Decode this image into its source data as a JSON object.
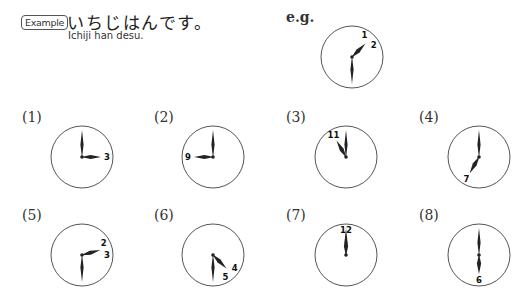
{
  "example": {
    "badge": "Example",
    "japanese": "いちじはんです。",
    "romaji": "Ichiji han desu.",
    "eg_label": "e.g."
  },
  "clocks": [
    {
      "id": "eg",
      "label": "",
      "cx": 352,
      "cy": 57,
      "hour_angle": 45,
      "minute_angle": 180,
      "numbers": [
        {
          "text": "1",
          "angle": 30
        },
        {
          "text": "2",
          "angle": 60
        }
      ]
    },
    {
      "id": "q1",
      "label": "(1)",
      "label_x": 22,
      "label_y": 109,
      "cx": 82,
      "cy": 157,
      "hour_angle": 90,
      "minute_angle": 0,
      "numbers": [
        {
          "text": "3",
          "angle": 90
        }
      ]
    },
    {
      "id": "q2",
      "label": "(2)",
      "label_x": 154,
      "label_y": 109,
      "cx": 213,
      "cy": 157,
      "hour_angle": 270,
      "minute_angle": 0,
      "numbers": [
        {
          "text": "9",
          "angle": 270
        }
      ]
    },
    {
      "id": "q3",
      "label": "(3)",
      "label_x": 286,
      "label_y": 109,
      "cx": 346,
      "cy": 157,
      "hour_angle": 330,
      "minute_angle": 0,
      "numbers": [
        {
          "text": "11",
          "angle": 330
        }
      ]
    },
    {
      "id": "q4",
      "label": "(4)",
      "label_x": 419,
      "label_y": 109,
      "cx": 479,
      "cy": 157,
      "hour_angle": 210,
      "minute_angle": 0,
      "numbers": [
        {
          "text": "7",
          "angle": 210
        }
      ]
    },
    {
      "id": "q5",
      "label": "(5)",
      "label_x": 22,
      "label_y": 207,
      "cx": 82,
      "cy": 255,
      "hour_angle": 75,
      "minute_angle": 180,
      "numbers": [
        {
          "text": "2",
          "angle": 60
        },
        {
          "text": "3",
          "angle": 90
        }
      ]
    },
    {
      "id": "q6",
      "label": "(6)",
      "label_x": 154,
      "label_y": 207,
      "cx": 213,
      "cy": 255,
      "hour_angle": 135,
      "minute_angle": 180,
      "numbers": [
        {
          "text": "4",
          "angle": 120
        },
        {
          "text": "5",
          "angle": 150
        }
      ]
    },
    {
      "id": "q7",
      "label": "(7)",
      "label_x": 286,
      "label_y": 207,
      "cx": 346,
      "cy": 255,
      "hour_angle": 0,
      "minute_angle": 0,
      "numbers": [
        {
          "text": "12",
          "angle": 0
        }
      ]
    },
    {
      "id": "q8",
      "label": "(8)",
      "label_x": 419,
      "label_y": 207,
      "cx": 479,
      "cy": 255,
      "hour_angle": 180,
      "minute_angle": 0,
      "numbers": [
        {
          "text": "6",
          "angle": 180
        }
      ]
    }
  ],
  "style": {
    "circle_radius": 31,
    "circle_stroke": "#555555",
    "hand_color": "#222222",
    "hour_hand_length": 19,
    "minute_hand_length": 27
  }
}
